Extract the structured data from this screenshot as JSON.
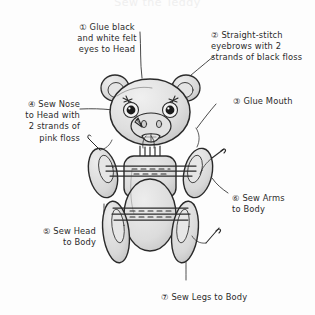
{
  "page": {
    "title": "Sew the Teddy",
    "background_color": "#fdfdfd",
    "ink_color": "#2b2b2b",
    "fill_color": "#dcdcdc",
    "fill_color_light": "#e8e8e8",
    "fill_color_dark": "#c9c9c9"
  },
  "steps": [
    {
      "marker": "①",
      "text": "① Glue black\nand white felt\neyes to Head",
      "align": "center"
    },
    {
      "marker": "②",
      "text": "② Straight-stitch\neyebrows with 2\nstrands of black floss",
      "align": "left"
    },
    {
      "marker": "③",
      "text": "③ Glue Mouth",
      "align": "left"
    },
    {
      "marker": "④",
      "text": "④ Sew Nose\nto Head with\n2 strands of\npink floss",
      "align": "right"
    },
    {
      "marker": "⑤",
      "text": "⑤ Sew Head\nto Body",
      "align": "right"
    },
    {
      "marker": "⑥",
      "text": "⑥ Sew Arms\nto Body",
      "align": "left"
    },
    {
      "marker": "⑦",
      "text": "⑦ Sew Legs to Body",
      "align": "center"
    }
  ],
  "figure": {
    "name": "teddy-bear-plush-diagram",
    "parts": [
      "left-ear",
      "right-ear",
      "head",
      "left-eye",
      "right-eye",
      "left-eyebrow",
      "right-eyebrow",
      "snout",
      "nose",
      "mouth",
      "neck-stitches",
      "torso",
      "left-arm",
      "right-arm",
      "left-leg",
      "right-leg",
      "arm-stitch-line",
      "leg-stitch-line",
      "needle-upper",
      "needle-lower"
    ]
  }
}
